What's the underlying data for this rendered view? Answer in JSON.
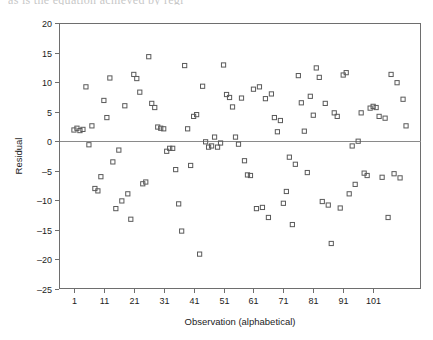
{
  "page": {
    "top_text_fragment": "as is the equation achieved by regr",
    "background_color": "#ffffff"
  },
  "chart_data": {
    "type": "scatter",
    "title": "",
    "xlabel": "Observation (alphabetical)",
    "ylabel": "Residual",
    "xlim": [
      -4,
      117
    ],
    "ylim": [
      -25,
      20
    ],
    "xticks": [
      1,
      11,
      21,
      31,
      41,
      51,
      61,
      71,
      81,
      91,
      101
    ],
    "xtick_labels": [
      "1",
      "11",
      "21",
      "31",
      "41",
      "51",
      "61",
      "71",
      "81",
      "91",
      "101"
    ],
    "yticks": [
      -25,
      -20,
      -15,
      -10,
      -5,
      0,
      5,
      10,
      15,
      20
    ],
    "ytick_labels": [
      "-25",
      "-20",
      "-15",
      "-10",
      "-5",
      "0",
      "5",
      "10",
      "15",
      "20"
    ],
    "grid": false,
    "legend": null,
    "zero_reference_line": 0,
    "marker_style": "open-square",
    "marker_color": "#5a5a5a",
    "frame_color": "#6e6e6e",
    "n_points": 112,
    "x": [
      1,
      2,
      3,
      4,
      5,
      6,
      7,
      8,
      9,
      10,
      11,
      12,
      13,
      14,
      15,
      16,
      17,
      18,
      19,
      20,
      21,
      22,
      23,
      24,
      25,
      26,
      27,
      28,
      29,
      30,
      31,
      32,
      33,
      34,
      35,
      36,
      37,
      38,
      39,
      40,
      41,
      42,
      43,
      44,
      45,
      46,
      47,
      48,
      49,
      50,
      51,
      52,
      53,
      54,
      55,
      56,
      57,
      58,
      59,
      60,
      61,
      62,
      63,
      64,
      65,
      66,
      67,
      68,
      69,
      70,
      71,
      72,
      73,
      74,
      75,
      76,
      77,
      78,
      79,
      80,
      81,
      82,
      83,
      84,
      85,
      86,
      87,
      88,
      89,
      90,
      91,
      92,
      93,
      94,
      95,
      96,
      97,
      98,
      99,
      100,
      101,
      102,
      103,
      104,
      105,
      106,
      107,
      108,
      109,
      110,
      111,
      112
    ],
    "y": [
      1.9,
      2.2,
      1.8,
      2.0,
      9.2,
      -0.6,
      2.6,
      -8.0,
      -8.4,
      -6.0,
      6.9,
      4.0,
      10.7,
      -3.5,
      -11.4,
      -1.5,
      -10.1,
      6.0,
      -8.9,
      -13.2,
      11.3,
      10.6,
      8.3,
      -7.2,
      -6.9,
      14.3,
      6.4,
      5.7,
      2.4,
      2.2,
      2.1,
      -1.7,
      -1.2,
      -1.2,
      -4.8,
      -10.6,
      -15.2,
      12.8,
      2.1,
      -4.1,
      4.2,
      4.5,
      -19.1,
      9.3,
      -0.1,
      -1.0,
      -0.8,
      0.7,
      -1.0,
      -0.3,
      12.9,
      7.9,
      7.4,
      5.8,
      0.7,
      -0.5,
      7.3,
      -3.3,
      -5.7,
      -5.8,
      8.8,
      -11.4,
      9.2,
      -11.2,
      7.2,
      -12.9,
      8.0,
      4.0,
      1.6,
      3.5,
      -10.5,
      -8.5,
      -2.7,
      -14.1,
      -3.9,
      11.1,
      6.5,
      1.7,
      -5.3,
      7.6,
      4.4,
      12.4,
      10.8,
      -10.2,
      6.4,
      -10.8,
      -17.3,
      4.8,
      4.2,
      -11.3,
      11.2,
      11.6,
      -8.9,
      -0.8,
      -7.3,
      0.0,
      4.8,
      -5.4,
      -5.8,
      5.6,
      5.9,
      5.7,
      4.2,
      -6.1,
      3.9,
      -12.9,
      11.3,
      -5.5,
      9.9,
      -6.2,
      7.1,
      2.6
    ]
  },
  "axes_geometry": {
    "note": "pixel frame of plotting area within the 433x340 image",
    "left_px": 59,
    "right_px": 421,
    "top_px": 23,
    "bottom_px": 289
  }
}
